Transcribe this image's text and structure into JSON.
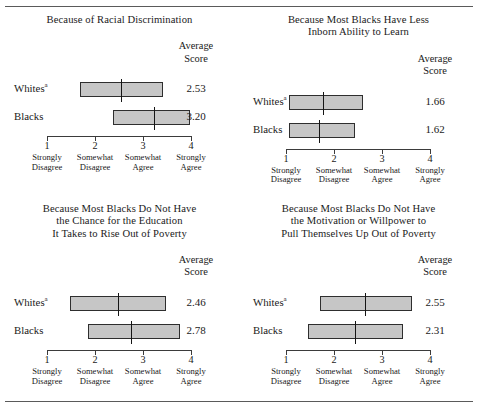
{
  "figure": {
    "axis": {
      "min": 1,
      "max": 4,
      "ticks": [
        {
          "value": "1",
          "caption_line1": "Strongly",
          "caption_line2": "Disagree"
        },
        {
          "value": "2",
          "caption_line1": "Somewhat",
          "caption_line2": "Disagree"
        },
        {
          "value": "3",
          "caption_line1": "Somewhat",
          "caption_line2": "Agree"
        },
        {
          "value": "4",
          "caption_line1": "Strongly",
          "caption_line2": "Agree"
        }
      ]
    },
    "average_header_line1": "Average",
    "average_header_line2": "Score",
    "group_labels": {
      "whites": "Whites",
      "whites_footnote": "a",
      "blacks": "Blacks"
    },
    "panels": [
      {
        "title_lines": [
          "Because of Racial Discrimination"
        ],
        "rows": [
          {
            "group": "Whites",
            "footnote": "a",
            "average": "2.53",
            "box_low": 1.69,
            "box_high": 3.42,
            "median": 2.53
          },
          {
            "group": "Blacks",
            "footnote": "",
            "average": "3.20",
            "box_low": 2.37,
            "box_high": 3.98,
            "median": 3.2
          }
        ]
      },
      {
        "title_lines": [
          "Because Most Blacks Have Less",
          "Inborn Ability to Learn"
        ],
        "rows": [
          {
            "group": "Whites",
            "footnote": "a",
            "average": "1.66",
            "box_low": 1.06,
            "box_high": 2.61,
            "median": 1.76
          },
          {
            "group": "Blacks",
            "footnote": "",
            "average": "1.62",
            "box_low": 1.06,
            "box_high": 2.44,
            "median": 1.66
          }
        ]
      },
      {
        "title_lines": [
          "Because Most Blacks Do Not Have",
          "the Chance for the Education",
          "It Takes to Rise Out of Poverty"
        ],
        "rows": [
          {
            "group": "Whites",
            "footnote": "a",
            "average": "2.46",
            "box_low": 1.48,
            "box_high": 3.48,
            "median": 2.46
          },
          {
            "group": "Blacks",
            "footnote": "",
            "average": "2.78",
            "box_low": 1.85,
            "box_high": 3.77,
            "median": 2.73
          }
        ]
      },
      {
        "title_lines": [
          "Because Most Blacks Do Not Have",
          "the Motivation or Willpower to",
          "Pull Themselves Up Out of Poverty"
        ],
        "rows": [
          {
            "group": "Whites",
            "footnote": "a",
            "average": "2.55",
            "box_low": 1.71,
            "box_high": 3.63,
            "median": 2.63
          },
          {
            "group": "Blacks",
            "footnote": "",
            "average": "2.31",
            "box_low": 1.46,
            "box_high": 3.44,
            "median": 2.42
          }
        ]
      }
    ]
  },
  "chart_data": {
    "type": "bar",
    "xlabel": "",
    "ylabel": "",
    "xlim": [
      1,
      4
    ],
    "grid": false,
    "legend": "none",
    "x_tick_labels": [
      "1 Strongly Disagree",
      "2 Somewhat Disagree",
      "3 Somewhat Agree",
      "4 Strongly Agree"
    ],
    "annotations": [
      "Average Score"
    ],
    "panels": [
      {
        "title": "Because of Racial Discrimination",
        "categories": [
          "Whites",
          "Blacks"
        ],
        "series": [
          {
            "name": "Average Score",
            "values": [
              2.53,
              3.2
            ]
          },
          {
            "name": "Box Low",
            "values": [
              1.69,
              2.37
            ]
          },
          {
            "name": "Box High",
            "values": [
              3.42,
              3.98
            ]
          },
          {
            "name": "Median Line",
            "values": [
              2.53,
              3.2
            ]
          }
        ]
      },
      {
        "title": "Because Most Blacks Have Less Inborn Ability to Learn",
        "categories": [
          "Whites",
          "Blacks"
        ],
        "series": [
          {
            "name": "Average Score",
            "values": [
              1.66,
              1.62
            ]
          },
          {
            "name": "Box Low",
            "values": [
              1.06,
              1.06
            ]
          },
          {
            "name": "Box High",
            "values": [
              2.61,
              2.44
            ]
          },
          {
            "name": "Median Line",
            "values": [
              1.76,
              1.66
            ]
          }
        ]
      },
      {
        "title": "Because Most Blacks Do Not Have the Chance for the Education It Takes to Rise Out of Poverty",
        "categories": [
          "Whites",
          "Blacks"
        ],
        "series": [
          {
            "name": "Average Score",
            "values": [
              2.46,
              2.78
            ]
          },
          {
            "name": "Box Low",
            "values": [
              1.48,
              1.85
            ]
          },
          {
            "name": "Box High",
            "values": [
              3.48,
              3.77
            ]
          },
          {
            "name": "Median Line",
            "values": [
              2.46,
              2.73
            ]
          }
        ]
      },
      {
        "title": "Because Most Blacks Do Not Have the Motivation or Willpower to Pull Themselves Up Out of Poverty",
        "categories": [
          "Whites",
          "Blacks"
        ],
        "series": [
          {
            "name": "Average Score",
            "values": [
              2.55,
              2.31
            ]
          },
          {
            "name": "Box Low",
            "values": [
              1.71,
              1.46
            ]
          },
          {
            "name": "Box High",
            "values": [
              3.63,
              3.44
            ]
          },
          {
            "name": "Median Line",
            "values": [
              2.63,
              2.42
            ]
          }
        ]
      }
    ]
  }
}
